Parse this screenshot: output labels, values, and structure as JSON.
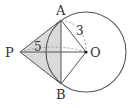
{
  "diagram": {
    "type": "geometry",
    "points": {
      "P": {
        "label": "P",
        "x": 20,
        "y": 52
      },
      "A": {
        "label": "A",
        "x": 61,
        "y": 20
      },
      "B": {
        "label": "B",
        "x": 61,
        "y": 84
      },
      "O": {
        "label": "O",
        "x": 86,
        "y": 52
      }
    },
    "circle": {
      "center": "O",
      "cx": 86,
      "cy": 52,
      "r": 40
    },
    "measurements": {
      "PO": "5",
      "AO": "3"
    },
    "colors": {
      "stroke": "#555555",
      "shade": "#d9d9d9",
      "dash": "#888888"
    }
  }
}
